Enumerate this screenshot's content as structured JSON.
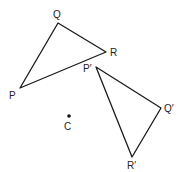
{
  "diagram": {
    "type": "geometric-rotation",
    "stroke_color": "#1a1a1a",
    "original_triangle": {
      "vertices": [
        {
          "name": "P",
          "label": "P",
          "x": 20,
          "y": 88,
          "lx": 9,
          "ly": 99
        },
        {
          "name": "Q",
          "label": "Q",
          "x": 58,
          "y": 23,
          "lx": 53,
          "ly": 18
        },
        {
          "name": "R",
          "label": "R",
          "x": 106,
          "y": 52,
          "lx": 110,
          "ly": 56
        }
      ]
    },
    "image_triangle": {
      "vertices": [
        {
          "name": "P'",
          "label": "P′",
          "x": 96,
          "y": 67,
          "lx": 83,
          "ly": 72
        },
        {
          "name": "Q'",
          "label": "Q′",
          "x": 161,
          "y": 108,
          "lx": 164,
          "ly": 112
        },
        {
          "name": "R'",
          "label": "R′",
          "x": 132,
          "y": 157,
          "lx": 127,
          "ly": 169
        }
      ]
    },
    "center": {
      "label": "C",
      "x": 69,
      "y": 116,
      "lx": 64,
      "ly": 130
    }
  }
}
